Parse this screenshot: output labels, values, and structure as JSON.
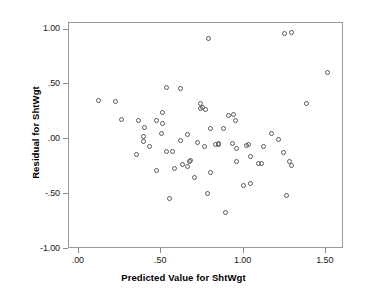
{
  "chart_data": {
    "type": "scatter",
    "title": "",
    "xlabel": "Predicted Value for ShtWgt",
    "ylabel": "Residual for ShtWgt",
    "xlim": [
      -0.06,
      1.61
    ],
    "ylim": [
      -1.0,
      1.06
    ],
    "grid": false,
    "legend": null,
    "xticks": [
      {
        "value": 0.0,
        "label": ".00"
      },
      {
        "value": 0.5,
        "label": ".50"
      },
      {
        "value": 1.0,
        "label": "1.00"
      },
      {
        "value": 1.5,
        "label": "1.50"
      }
    ],
    "yticks": [
      {
        "value": 1.0,
        "label": "1.00"
      },
      {
        "value": 0.5,
        "label": ".50"
      },
      {
        "value": 0.0,
        "label": ".00"
      },
      {
        "value": -0.5,
        "label": "-.50"
      },
      {
        "value": -1.0,
        "label": "-1.00"
      }
    ],
    "marker": {
      "shape": "open-circle",
      "edge_color": "#5a5a5a",
      "fill": "none",
      "size": 5
    },
    "points": [
      {
        "x": 0.12,
        "y": 0.35
      },
      {
        "x": 0.22,
        "y": 0.34
      },
      {
        "x": 0.26,
        "y": 0.18
      },
      {
        "x": 0.36,
        "y": 0.17
      },
      {
        "x": 0.35,
        "y": -0.14
      },
      {
        "x": 0.4,
        "y": 0.11
      },
      {
        "x": 0.39,
        "y": 0.03
      },
      {
        "x": 0.39,
        "y": -0.02
      },
      {
        "x": 0.43,
        "y": -0.07
      },
      {
        "x": 0.47,
        "y": 0.17
      },
      {
        "x": 0.47,
        "y": -0.28
      },
      {
        "x": 0.5,
        "y": 0.05
      },
      {
        "x": 0.51,
        "y": 0.24
      },
      {
        "x": 0.51,
        "y": 0.14
      },
      {
        "x": 0.53,
        "y": 0.47
      },
      {
        "x": 0.53,
        "y": -0.11
      },
      {
        "x": 0.55,
        "y": -0.54
      },
      {
        "x": 0.57,
        "y": -0.11
      },
      {
        "x": 0.58,
        "y": -0.27
      },
      {
        "x": 0.62,
        "y": 0.46
      },
      {
        "x": 0.62,
        "y": -0.01
      },
      {
        "x": 0.63,
        "y": -0.23
      },
      {
        "x": 0.66,
        "y": 0.04
      },
      {
        "x": 0.66,
        "y": -0.25
      },
      {
        "x": 0.67,
        "y": -0.2
      },
      {
        "x": 0.68,
        "y": -0.19
      },
      {
        "x": 0.7,
        "y": -0.35
      },
      {
        "x": 0.72,
        "y": -0.03
      },
      {
        "x": 0.74,
        "y": 0.28
      },
      {
        "x": 0.74,
        "y": 0.33
      },
      {
        "x": 0.75,
        "y": 0.29
      },
      {
        "x": 0.76,
        "y": -0.07
      },
      {
        "x": 0.77,
        "y": 0.27
      },
      {
        "x": 0.78,
        "y": -0.49
      },
      {
        "x": 0.79,
        "y": 0.92
      },
      {
        "x": 0.8,
        "y": 0.1
      },
      {
        "x": 0.8,
        "y": -0.3
      },
      {
        "x": 0.83,
        "y": -0.05
      },
      {
        "x": 0.85,
        "y": -0.04
      },
      {
        "x": 0.85,
        "y": -0.05
      },
      {
        "x": 0.88,
        "y": 0.1
      },
      {
        "x": 0.89,
        "y": -0.67
      },
      {
        "x": 0.91,
        "y": 0.22
      },
      {
        "x": 0.93,
        "y": -0.04
      },
      {
        "x": 0.94,
        "y": 0.23
      },
      {
        "x": 0.95,
        "y": 0.17
      },
      {
        "x": 0.96,
        "y": -0.08
      },
      {
        "x": 0.96,
        "y": -0.2
      },
      {
        "x": 1.0,
        "y": -0.42
      },
      {
        "x": 1.02,
        "y": -0.06
      },
      {
        "x": 1.03,
        "y": -0.05
      },
      {
        "x": 1.04,
        "y": -0.4
      },
      {
        "x": 1.04,
        "y": -0.16
      },
      {
        "x": 1.09,
        "y": -0.22
      },
      {
        "x": 1.11,
        "y": -0.22
      },
      {
        "x": 1.12,
        "y": -0.07
      },
      {
        "x": 1.17,
        "y": 0.05
      },
      {
        "x": 1.21,
        "y": 0.0
      },
      {
        "x": 1.24,
        "y": -0.12
      },
      {
        "x": 1.25,
        "y": 0.96
      },
      {
        "x": 1.26,
        "y": -0.51
      },
      {
        "x": 1.28,
        "y": -0.2
      },
      {
        "x": 1.29,
        "y": 0.97
      },
      {
        "x": 1.29,
        "y": -0.24
      },
      {
        "x": 1.38,
        "y": 0.33
      },
      {
        "x": 1.51,
        "y": 0.61
      }
    ]
  }
}
